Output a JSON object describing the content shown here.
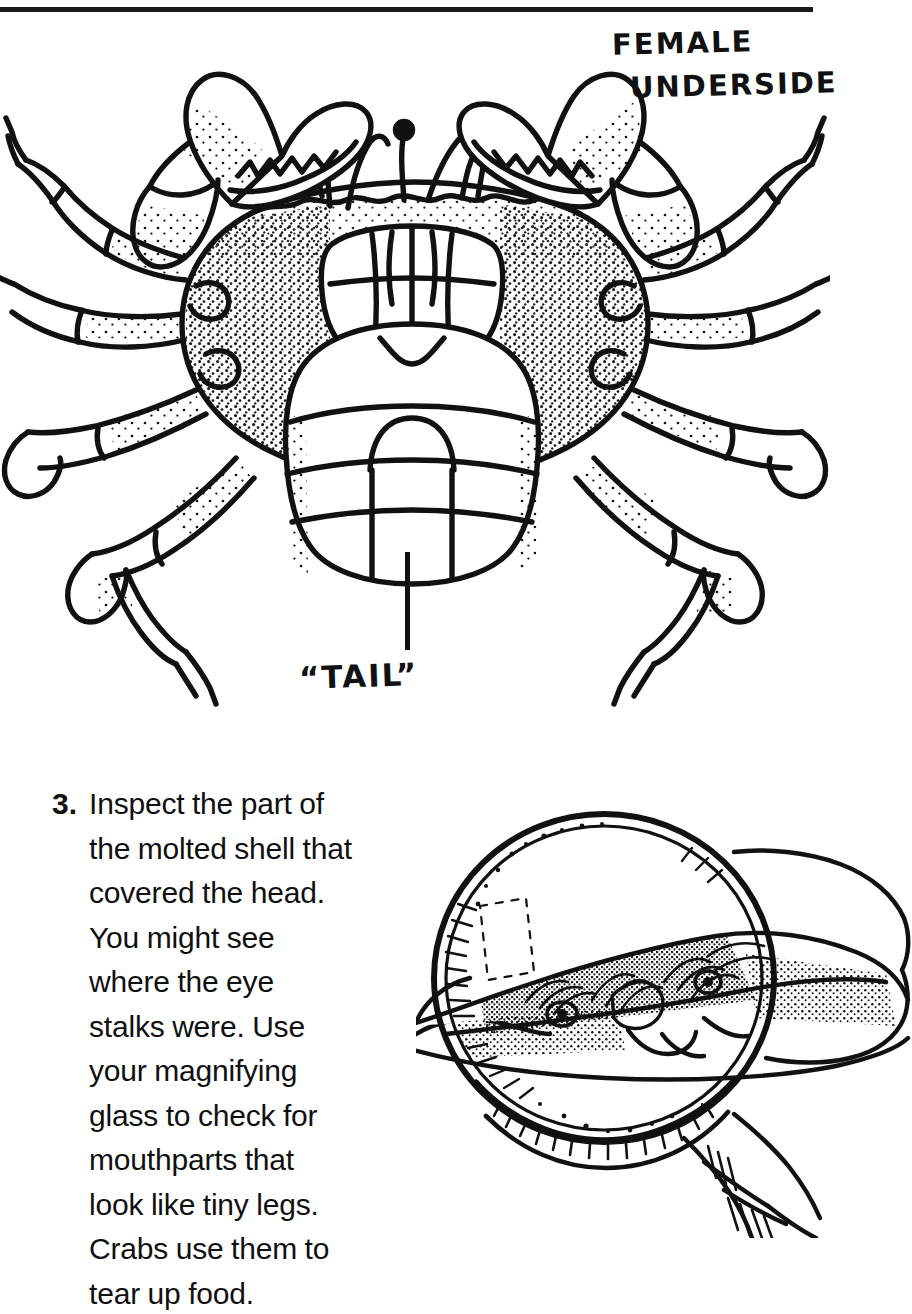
{
  "page": {
    "background_color": "#ffffff",
    "ink_color": "#111111"
  },
  "top_rule": {
    "name": "horizontal-rule"
  },
  "crab_figure": {
    "caption_line_1": "FEMALE",
    "caption_line_2": "UNDERSIDE",
    "tail_label": "“TAIL”",
    "subject": "crab-underside-line-drawing",
    "description": "Pen and ink drawing of the underside of a female crab showing two claws, eight walking legs, stippled shell plates, eye stalks and the broad rounded abdominal flap known as the tail"
  },
  "instruction": {
    "number": "3.",
    "body": "Inspect the part of the molted shell that covered the head. You might see where the eye stalks were. Use your magnifying glass to check for mouthparts that look like tiny legs. Crabs use them to tear up food.",
    "lines": [
      "Inspect the part of the",
      "molted shell that",
      "covered the head. You",
      "might see where the",
      "eye stalks were. Use",
      "your magnifying glass",
      "to check for mouthparts",
      "that look like tiny legs.",
      "Crabs use them to tear",
      "up food."
    ]
  },
  "magnifier_figure": {
    "subject": "magnifying-glass-over-crab-shell",
    "description": "A hand holds a round magnifying glass with a ribbed handle over a molted crab head shell, enlarging the eye stalk sockets and hairy mouthparts inside the lens"
  }
}
